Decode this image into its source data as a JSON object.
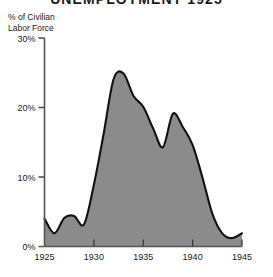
{
  "chart_data": {
    "type": "area",
    "title": "UNEMPLOYMENT 1925",
    "ylabel": "% of Civilian\nLabor Force",
    "ylabel_line1": "% of Civilian",
    "ylabel_line2": "Labor Force",
    "xlabel": "",
    "xlim": [
      1925,
      1945
    ],
    "ylim": [
      0,
      30
    ],
    "grid": false,
    "legend": "none",
    "yticks": [
      0,
      10,
      20,
      30
    ],
    "ytick_labels": [
      "0%",
      "10%",
      "20%",
      "30%"
    ],
    "xticks": [
      1925,
      1930,
      1935,
      1940,
      1945
    ],
    "xtick_labels": [
      "1925",
      "1930",
      "1935",
      "1940",
      "1945"
    ],
    "x": [
      1925,
      1926,
      1927,
      1928,
      1929,
      1930,
      1931,
      1932,
      1933,
      1934,
      1935,
      1936,
      1937,
      1938,
      1939,
      1940,
      1941,
      1942,
      1943,
      1944,
      1945
    ],
    "values": [
      4.0,
      1.9,
      4.1,
      4.4,
      3.2,
      8.9,
      16.3,
      24.1,
      24.9,
      21.7,
      20.1,
      17.0,
      14.3,
      19.1,
      17.2,
      14.6,
      9.9,
      4.7,
      1.9,
      1.2,
      1.9
    ],
    "series": [
      {
        "name": "Unemployment rate",
        "values": [
          4.0,
          1.9,
          4.1,
          4.4,
          3.2,
          8.9,
          16.3,
          24.1,
          24.9,
          21.7,
          20.1,
          17.0,
          14.3,
          19.1,
          17.2,
          14.6,
          9.9,
          4.7,
          1.9,
          1.2,
          1.9
        ]
      }
    ],
    "colors": {
      "fill": "#8b8b8b",
      "line": "#111111",
      "axis": "#555555",
      "text": "#1a1a1a",
      "background": "#ffffff"
    }
  }
}
